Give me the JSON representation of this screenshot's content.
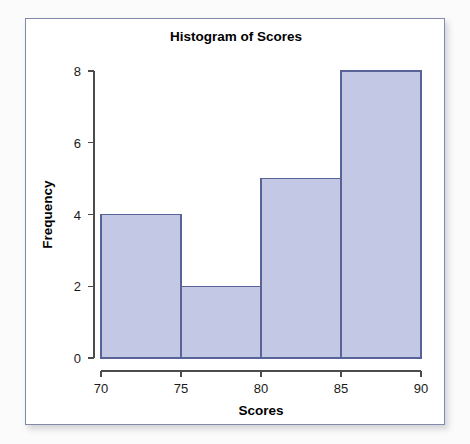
{
  "figure": {
    "title": "Histogram of Scores",
    "background_color": "#ffffff",
    "page_background_color": "#fbfbfb",
    "frame_border_color": "#8189ad"
  },
  "chart_data": {
    "type": "bar",
    "title": "Histogram of Scores",
    "xlabel": "Scores",
    "ylabel": "Frequency",
    "bin_edges": [
      70,
      75,
      80,
      85,
      90
    ],
    "bin_width": 5,
    "categories": [
      "70-75",
      "75-80",
      "80-85",
      "85-90"
    ],
    "values": [
      4,
      2,
      5,
      8
    ],
    "xlim": [
      70,
      90
    ],
    "ylim": [
      0,
      8
    ],
    "xticks": [
      70,
      75,
      80,
      85,
      90
    ],
    "yticks": [
      0,
      2,
      4,
      6,
      8
    ],
    "xtick_labels": [
      "70",
      "75",
      "80",
      "85",
      "90"
    ],
    "ytick_labels": [
      "0",
      "2",
      "4",
      "6",
      "8"
    ],
    "grid": false,
    "legend": null,
    "bar_fill_color": "#c3c9e4",
    "bar_edge_color": "#5a6398"
  }
}
